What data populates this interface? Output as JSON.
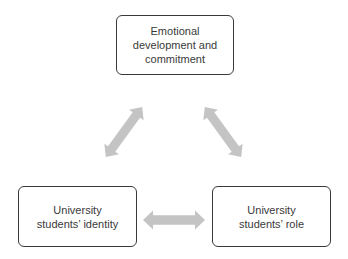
{
  "diagram": {
    "nodes": [
      {
        "id": "top",
        "lines": [
          "Emotional",
          "development and",
          "commitment"
        ]
      },
      {
        "id": "left",
        "lines": [
          "University",
          "students’ identity"
        ]
      },
      {
        "id": "right",
        "lines": [
          "University",
          "students’ role"
        ]
      }
    ],
    "edges": [
      {
        "from": "top",
        "to": "left",
        "type": "bidirectional"
      },
      {
        "from": "top",
        "to": "right",
        "type": "bidirectional"
      },
      {
        "from": "left",
        "to": "right",
        "type": "bidirectional"
      }
    ],
    "colors": {
      "border": "#3a3a3a",
      "text": "#3a3a3a",
      "arrow": "#c4c4c4"
    }
  }
}
